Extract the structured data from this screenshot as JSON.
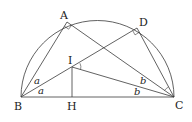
{
  "figure": {
    "type": "geometry",
    "points": {
      "A": {
        "label": "A",
        "x": 67,
        "y": 22
      },
      "D": {
        "label": "D",
        "x": 137,
        "y": 28
      },
      "I": {
        "label": "I",
        "x": 72,
        "y": 67
      },
      "B": {
        "label": "B",
        "x": 21,
        "y": 97
      },
      "H": {
        "label": "H",
        "x": 72,
        "y": 97
      },
      "C": {
        "label": "C",
        "x": 174,
        "y": 97
      }
    },
    "angle_labels": {
      "a_upper": "a",
      "a_lower": "a",
      "b_upper": "b",
      "b_lower": "b"
    },
    "segments": [
      "BC",
      "BA",
      "AC",
      "BD",
      "DC",
      "BI",
      "IC",
      "IH"
    ],
    "right_angles": [
      "BAC",
      "BDC"
    ],
    "colors": {
      "stroke": "#3a3a3a",
      "text": "#222222",
      "background": "#ffffff"
    }
  }
}
